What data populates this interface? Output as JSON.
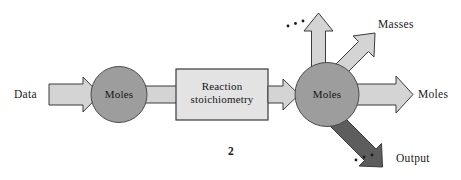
{
  "diagram": {
    "figure_number": "2",
    "nodes": [
      {
        "id": "circle-one",
        "label": "Moles",
        "shape": "circle",
        "fill": "#9d9d9d"
      },
      {
        "id": "process-box",
        "label_line1": "Reaction",
        "label_line2": "stoichiometry",
        "shape": "rect",
        "fill": "#e3e3e3"
      },
      {
        "id": "circle-two",
        "label": "Moles",
        "shape": "circle",
        "fill": "#9d9d9d"
      }
    ],
    "labels": {
      "data": "Data",
      "masses": "Masses",
      "moles_out": "Moles",
      "output": "Output"
    },
    "ellipsis": {
      "top": "...",
      "bottom": "..."
    },
    "colors": {
      "arrow_light": "#d4d4d4",
      "arrow_dark": "#5d5d5d",
      "node_gray": "#9d9d9d",
      "box_gray": "#e3e3e3",
      "stroke": "#3a3a3a",
      "text": "#151515",
      "background": "#ffffff"
    }
  }
}
